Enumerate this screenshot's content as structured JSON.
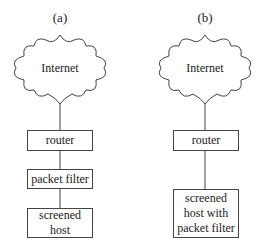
{
  "diagram": {
    "panels": [
      {
        "label": "(a)",
        "cloud": "Internet",
        "boxes": [
          {
            "lines": [
              "router"
            ]
          },
          {
            "lines": [
              "packet filter"
            ]
          },
          {
            "lines": [
              "screened",
              "host"
            ]
          }
        ]
      },
      {
        "label": "(b)",
        "cloud": "Internet",
        "boxes": [
          {
            "lines": [
              "router"
            ]
          },
          {
            "lines": [
              "screened",
              "host with",
              "packet filter"
            ]
          }
        ]
      }
    ],
    "colors": {
      "stroke": "#444444",
      "background": "#ffffff"
    }
  }
}
